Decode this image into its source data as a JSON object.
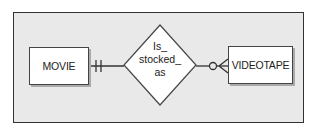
{
  "diagram": {
    "type": "ER diagram",
    "entities": [
      {
        "id": "movie",
        "label": "MOVIE"
      },
      {
        "id": "videotape",
        "label": "VIDEOTAPE"
      }
    ],
    "relationship": {
      "label_lines": [
        "Is_",
        "stocked_",
        "as"
      ],
      "label": "Is_stocked_as"
    },
    "cardinality": {
      "movie_side": "mandatory one (||)",
      "videotape_side": "optional many (o<)"
    },
    "colors": {
      "background": "#e9e9e9",
      "stroke": "#333333",
      "entity_fill": "#ffffff"
    }
  }
}
